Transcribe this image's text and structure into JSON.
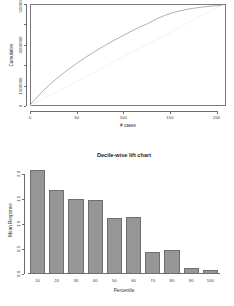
{
  "chart_data": [
    {
      "type": "line",
      "title": "",
      "xlabel": "# cases",
      "ylabel": "Cumulative",
      "xlim": [
        0,
        210
      ],
      "ylim": [
        0,
        5000000
      ],
      "xticks": [
        0,
        50,
        100,
        150,
        200
      ],
      "xticklabels": [
        "0",
        "50",
        "100",
        "150",
        "200"
      ],
      "yticks": [
        0,
        1000000,
        2000000,
        3000000,
        4000000,
        5000000
      ],
      "yticklabels": [
        "0",
        "1000000",
        "",
        "3000000",
        "",
        "5000000"
      ],
      "ytick_shown": [
        "0",
        "1000000",
        "3000000",
        "5000000"
      ],
      "grid": false,
      "legend": "none",
      "series": [
        {
          "name": "Cumulative lift",
          "color": "#9c9c9c",
          "x": [
            0,
            10,
            20,
            30,
            40,
            50,
            60,
            70,
            80,
            90,
            100,
            110,
            120,
            125,
            135,
            145,
            155,
            165,
            175,
            185,
            195,
            205
          ],
          "y": [
            40000,
            560000,
            1010000,
            1400000,
            1760000,
            2090000,
            2400000,
            2690000,
            2960000,
            3220000,
            3460000,
            3700000,
            3920000,
            4010000,
            4260000,
            4450000,
            4600000,
            4710000,
            4790000,
            4850000,
            4900000,
            4930000
          ]
        },
        {
          "name": "Baseline",
          "color": "#ededed",
          "x": [
            0,
            205
          ],
          "y": [
            0,
            4930000
          ]
        }
      ]
    },
    {
      "type": "bar",
      "title": "Decile-wise lift chart",
      "xlabel": "Percentile",
      "ylabel": "Mean Response",
      "categories": [
        "10",
        "20",
        "30",
        "40",
        "50",
        "60",
        "70",
        "80",
        "90",
        "100"
      ],
      "values": [
        2.07,
        1.68,
        1.49,
        1.48,
        1.11,
        1.13,
        0.43,
        0.47,
        0.12,
        0.07
      ],
      "ylim": [
        0,
        2.15
      ],
      "yticks": [
        0.0,
        0.5,
        1.0,
        1.5,
        2.0
      ],
      "yticklabels": [
        "0.0",
        "0.5",
        "1.0",
        "1.5",
        "2.0"
      ],
      "bar_color": "#969696",
      "bar_border": "#6f6f6f",
      "grid": false,
      "legend": "none"
    }
  ]
}
